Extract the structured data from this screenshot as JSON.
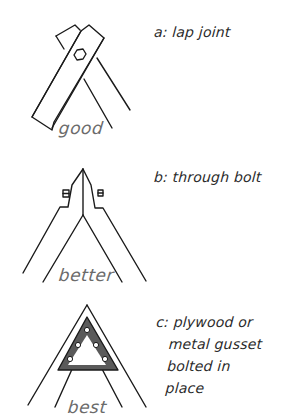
{
  "diagram": {
    "panels": [
      {
        "id": "a",
        "caption_lines": [
          "a: lap joint"
        ],
        "rating": "good",
        "illustration": "two crossed rafter boards overlapping at the apex, joined by a single hex bolt"
      },
      {
        "id": "b",
        "caption_lines": [
          "b: through bolt"
        ],
        "rating": "better",
        "illustration": "two rafters butted at the apex with vertical cheek pieces, bolted through with two bolt heads"
      },
      {
        "id": "c",
        "caption_lines": [
          "c: plywood or",
          "metal gusset",
          "bolted in",
          "place"
        ],
        "rating": "best",
        "illustration": "two rafters meeting at apex reinforced by a triangular gusset plate with six bolt holes"
      }
    ],
    "colors": {
      "ink": "#1a1a1a",
      "rating_text": "#6b6b6b",
      "gusset_fill": "#5a5a5a",
      "background": "#ffffff"
    }
  }
}
